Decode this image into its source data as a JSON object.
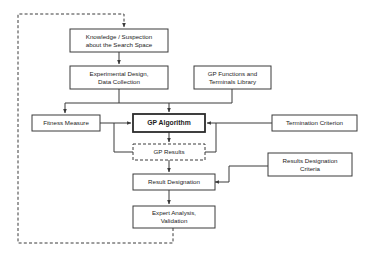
{
  "diagram": {
    "background_color": "#ffffff",
    "line_color": "#3a3a3a",
    "text_color": "#1c1c1c",
    "nodes": [
      {
        "id": "knowledge",
        "line1": "Knowledge / Suspection",
        "line2": "about the Search Space",
        "style": "solid"
      },
      {
        "id": "experimental",
        "line1": "Experimental Design,",
        "line2": "Data Collection",
        "style": "solid"
      },
      {
        "id": "library",
        "line1": "GP Functions and",
        "line2": "Terminals Library",
        "style": "solid"
      },
      {
        "id": "fitness",
        "line1": "Fitness Measure",
        "line2": "",
        "style": "solid"
      },
      {
        "id": "algorithm",
        "line1": "GP Algorithm",
        "line2": "",
        "style": "emphasis"
      },
      {
        "id": "termination",
        "line1": "Termination Criterion",
        "line2": "",
        "style": "solid"
      },
      {
        "id": "results",
        "line1": "GP Results",
        "line2": "",
        "style": "dashed"
      },
      {
        "id": "criteria",
        "line1": "Results Designation",
        "line2": "Criteria",
        "style": "solid"
      },
      {
        "id": "designation",
        "line1": "Result Designation",
        "line2": "",
        "style": "solid"
      },
      {
        "id": "expert",
        "line1": "Expert Analysis,",
        "line2": "Validation",
        "style": "solid"
      }
    ]
  }
}
